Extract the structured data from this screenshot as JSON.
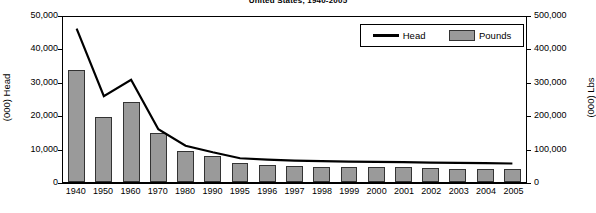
{
  "chart_data": {
    "type": "bar",
    "title": "United States, 1940-2005",
    "xlabel": "",
    "ylabel": "(000) Head",
    "y2label": "(000) Lbs",
    "ylim": [
      0,
      50000
    ],
    "y2lim": [
      0,
      500000
    ],
    "yticks": [
      "0",
      "10,000",
      "20,000",
      "30,000",
      "40,000",
      "50,000"
    ],
    "y2ticks": [
      "0",
      "100,000",
      "200,000",
      "300,000",
      "400,000",
      "500,000"
    ],
    "grid": false,
    "legend_position": "top-right",
    "categories": [
      "1940",
      "1950",
      "1960",
      "1970",
      "1980",
      "1990",
      "1995",
      "1996",
      "1997",
      "1998",
      "1999",
      "2000",
      "2001",
      "2002",
      "2003",
      "2004",
      "2005"
    ],
    "series": [
      {
        "name": "Pounds",
        "type": "bar",
        "axis": "right",
        "units": "(000) Lbs",
        "values": [
          338000,
          198000,
          241000,
          148000,
          95000,
          80000,
          57000,
          52000,
          48000,
          46000,
          45000,
          44000,
          44000,
          41000,
          39000,
          38000,
          39000
        ]
      },
      {
        "name": "Head",
        "type": "line",
        "axis": "left",
        "units": "(000) Head",
        "values": [
          46500,
          26000,
          31000,
          16000,
          11000,
          9000,
          7200,
          6800,
          6500,
          6300,
          6200,
          6100,
          6000,
          5900,
          5800,
          5700,
          5600
        ]
      }
    ]
  },
  "legend": {
    "head_label": "Head",
    "pounds_label": "Pounds"
  },
  "colors": {
    "bar_fill": "#9a9a9a",
    "bar_stroke": "#333333",
    "line": "#000000",
    "axis": "#000000"
  }
}
